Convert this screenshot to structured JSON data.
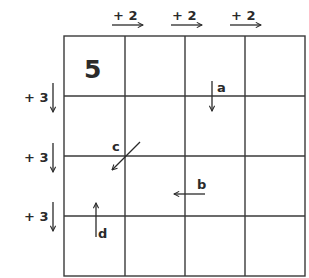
{
  "grid": {
    "rows": 4,
    "cols": 4,
    "start_cell": {
      "row": 0,
      "col": 0,
      "value": "5"
    }
  },
  "column_steps": [
    {
      "label": "+ 2",
      "direction": "right"
    },
    {
      "label": "+ 2",
      "direction": "right"
    },
    {
      "label": "+ 2",
      "direction": "right"
    }
  ],
  "row_steps": [
    {
      "label": "+ 3",
      "direction": "down"
    },
    {
      "label": "+ 3",
      "direction": "down"
    },
    {
      "label": "+ 3",
      "direction": "down"
    }
  ],
  "arrows": [
    {
      "label": "a",
      "direction": "down"
    },
    {
      "label": "b",
      "direction": "left"
    },
    {
      "label": "c",
      "direction": "down-left"
    },
    {
      "label": "d",
      "direction": "up"
    }
  ]
}
